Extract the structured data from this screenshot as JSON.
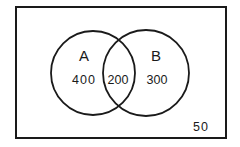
{
  "diagram": {
    "type": "venn",
    "colors": {
      "stroke": "#1a1a1a",
      "background": "#ffffff"
    },
    "universe": {
      "outside_count": "50"
    },
    "sets": [
      {
        "name": "A",
        "only_count": "400"
      },
      {
        "name": "B",
        "only_count": "300"
      }
    ],
    "intersection": {
      "sets": [
        "A",
        "B"
      ],
      "count": "200"
    }
  }
}
